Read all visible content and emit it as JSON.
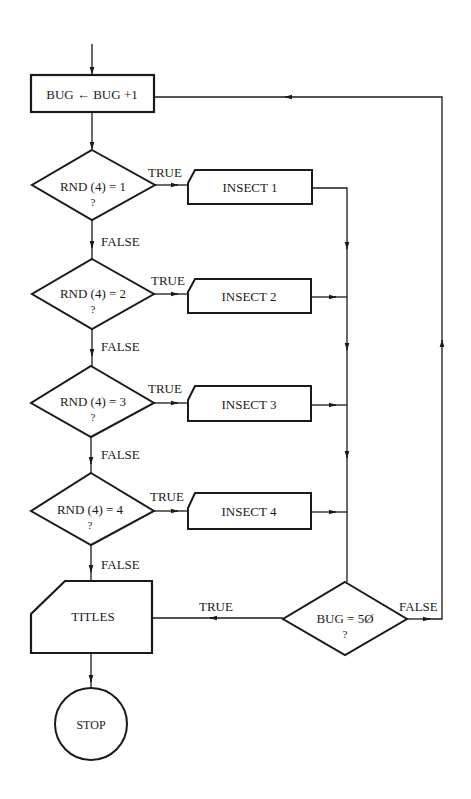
{
  "colors": {
    "ink": "#1a1a1a",
    "background": "#ffffff"
  },
  "nodes": {
    "increment": {
      "label": "BUG ← BUG +1"
    },
    "decision1": {
      "line1": "RND (4) = 1",
      "line2": "?"
    },
    "decision2": {
      "line1": "RND (4) = 2",
      "line2": "?"
    },
    "decision3": {
      "line1": "RND (4) = 3",
      "line2": "?"
    },
    "decision4": {
      "line1": "RND (4) = 4",
      "line2": "?"
    },
    "insect1": {
      "label": "INSECT 1"
    },
    "insect2": {
      "label": "INSECT 2"
    },
    "insect3": {
      "label": "INSECT 3"
    },
    "insect4": {
      "label": "INSECT 4"
    },
    "titles": {
      "label": "TITLES"
    },
    "check_bug": {
      "line1": "BUG = 5Ø",
      "line2": "?"
    },
    "stop": {
      "label": "STOP"
    }
  },
  "edge_labels": {
    "true1": "TRUE",
    "true2": "TRUE",
    "true3": "TRUE",
    "true4": "TRUE",
    "false1": "FALSE",
    "false2": "FALSE",
    "false3": "FALSE",
    "false4": "FALSE",
    "check_true": "TRUE",
    "check_false": "FALSE"
  }
}
